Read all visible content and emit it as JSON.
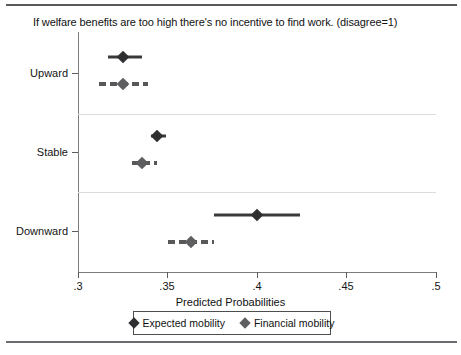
{
  "chart_data": {
    "type": "scatter",
    "title": "If welfare benefits are too high there's no incentive to find work. (disagree=1)",
    "xlabel": "Predicted Probabilities",
    "ylabel": "",
    "xlim": [
      0.3,
      0.5
    ],
    "xticks": [
      0.3,
      0.35,
      0.4,
      0.45,
      0.5
    ],
    "xticklabels": [
      ".3",
      ".35",
      ".4",
      ".45",
      ".5"
    ],
    "categories": [
      "Upward",
      "Stable",
      "Downward"
    ],
    "grid": "horizontal-separators",
    "legend_position": "below-axis",
    "series": [
      {
        "name": "Expected mobility",
        "marker": "diamond",
        "line_style": "solid",
        "color": "#2f2f31",
        "values": [
          0.325,
          0.344,
          0.4
        ],
        "ci_low": [
          0.317,
          0.341,
          0.376
        ],
        "ci_high": [
          0.336,
          0.349,
          0.424
        ]
      },
      {
        "name": "Financial mobility",
        "marker": "diamond",
        "line_style": "dashed",
        "color": "#5e5e60",
        "values": [
          0.325,
          0.336,
          0.363
        ],
        "ci_low": [
          0.312,
          0.33,
          0.35
        ],
        "ci_high": [
          0.339,
          0.344,
          0.376
        ]
      }
    ]
  },
  "legend": {
    "entries": [
      {
        "label": "Expected mobility"
      },
      {
        "label": "Financial mobility"
      }
    ]
  }
}
